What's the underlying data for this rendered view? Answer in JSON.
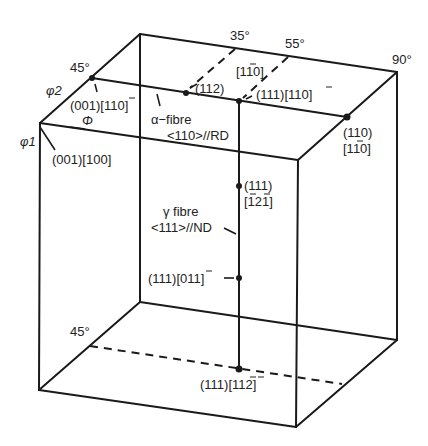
{
  "diagram": {
    "type": "Euler space cube (orientation fibres)",
    "axes": {
      "phi1": "φ1",
      "phi": "Φ",
      "phi2": "φ2"
    },
    "angle_labels": {
      "left_45_top": "45°",
      "top_35": "35°",
      "top_55": "55°",
      "top_90": "90°",
      "bottom_45": "45°"
    },
    "labels": {
      "o001_110": "(001)[1̄1̅0]",
      "o001_100": "(001)[100]",
      "alpha_fibre_line1": "α−fibre",
      "alpha_fibre_line2": "<110>//RD",
      "o112": "(112)",
      "dir_110_top": "[1̅1̅0]",
      "o111_110": "(111)[1̅1̅0]",
      "o110_line1": "(110)",
      "o110_line2": "[1̅1̅0]",
      "o111_121_line1": "(111)",
      "o111_121_line2": "[1̅2̅1]",
      "gamma_fibre_line1": "γ fibre",
      "gamma_fibre_line2": "<111>//ND",
      "o111_011": "(111)[01̅1]",
      "o111_112": "(111)[1̅1̅2]"
    }
  },
  "display_labels": {
    "o001_110": "(001)[1T0]",
    "dir_110_top": "[1T0]",
    "o111_110": "(111)[1T0]",
    "o110_line2": "[1T0]",
    "o111_121_line2": "[T2T]",
    "o111_011": "(111)[0T1]",
    "o111_112": "(111)[TT2]"
  },
  "colors": {
    "line": "#1a1a1a",
    "text": "#222222",
    "background": "#ffffff"
  }
}
